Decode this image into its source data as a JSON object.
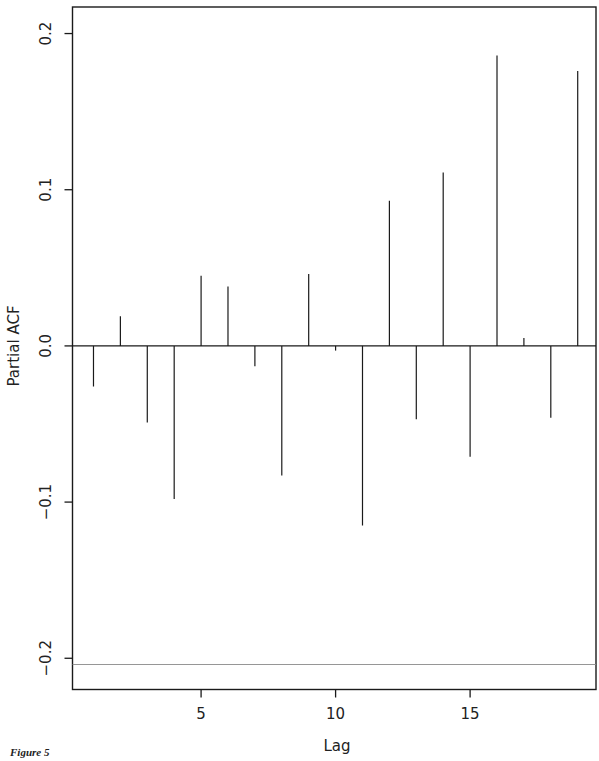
{
  "chart_data": {
    "type": "bar",
    "subtype": "stem",
    "title": "",
    "xlabel": "Lag",
    "ylabel": "Partial ACF",
    "x": [
      1,
      2,
      3,
      4,
      5,
      6,
      7,
      8,
      9,
      10,
      11,
      12,
      13,
      14,
      15,
      16,
      17,
      18,
      19
    ],
    "values": [
      -0.026,
      0.019,
      -0.049,
      -0.098,
      0.045,
      0.038,
      -0.013,
      -0.083,
      0.046,
      -0.003,
      -0.115,
      0.093,
      -0.047,
      0.111,
      -0.071,
      0.186,
      0.005,
      -0.046,
      0.176
    ],
    "xticks": [
      5,
      10,
      15
    ],
    "xtick_labels": [
      "5",
      "10",
      "15"
    ],
    "yticks": [
      -0.2,
      -0.1,
      0.0,
      0.1,
      0.2
    ],
    "ytick_labels": [
      "-0.2",
      "-0.1",
      "0.0",
      "0.1",
      "0.2"
    ],
    "xlim": [
      0.22,
      19.68
    ],
    "ylim": [
      -0.22,
      0.217
    ],
    "reference_lines": [
      {
        "type": "horizontal",
        "y": 0.0,
        "style": "solid",
        "color": "#1a1a1a"
      },
      {
        "type": "horizontal",
        "y": -0.204,
        "style": "solid-thin",
        "color": "#8a8a8a"
      }
    ],
    "grid": false,
    "legend": null
  },
  "caption": {
    "text": "Figure 5"
  },
  "colors": {
    "stems": "#1a1a1a",
    "frame": "#1a1a1a",
    "reference_line": "#8a8a8a",
    "background": "#ffffff"
  }
}
